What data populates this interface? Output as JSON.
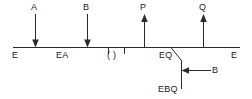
{
  "diagram": {
    "title": "",
    "axis": {
      "name": "horizontal-energy-axis",
      "left_endpoint_label": "E",
      "right_endpoint_label": "E"
    },
    "axis_labels": [
      {
        "text": "E",
        "name": "axis-label-e-left"
      },
      {
        "text": "EA",
        "name": "axis-label-ea"
      },
      {
        "text": "( )",
        "name": "axis-label-empty-parens"
      },
      {
        "text": "EQ",
        "name": "axis-label-eq"
      },
      {
        "text": "E",
        "name": "axis-label-e-right"
      }
    ],
    "arrows": [
      {
        "label": "A",
        "direction": "down",
        "name": "arrow-a"
      },
      {
        "label": "B",
        "direction": "down",
        "name": "arrow-b-top"
      },
      {
        "label": "P",
        "direction": "up",
        "name": "arrow-p"
      },
      {
        "label": "Q",
        "direction": "up",
        "name": "arrow-q"
      }
    ],
    "branch": {
      "name": "eq-branch",
      "terminal_label": "EBQ",
      "arrow_label": "B",
      "arrow_direction": "left"
    },
    "colors": {
      "stroke": "#2b2b2b",
      "text": "#1a1a1a",
      "background": "#ffffff"
    }
  }
}
